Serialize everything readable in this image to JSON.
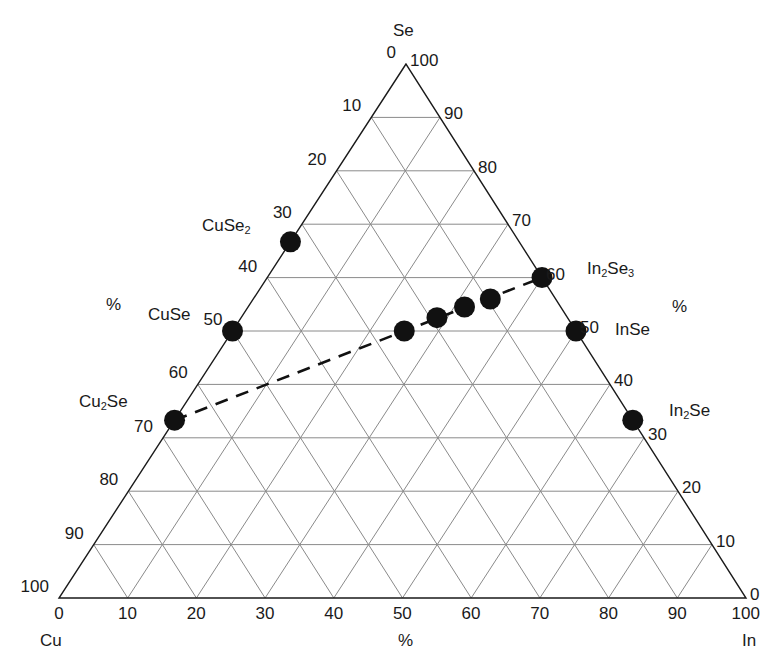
{
  "chart_data": {
    "type": "ternary-scatter",
    "title": "",
    "vertices": {
      "top": "Se",
      "bottom_left": "Cu",
      "bottom_right": "In"
    },
    "axis_unit_label": "%",
    "ticks": [
      0,
      10,
      20,
      30,
      40,
      50,
      60,
      70,
      80,
      90,
      100
    ],
    "left_axis_ticks_top_to_bottom": [
      "0",
      "10",
      "20",
      "30",
      "40",
      "50",
      "60",
      "70",
      "80",
      "90",
      "100"
    ],
    "right_axis_ticks_top_to_bottom": [
      "100",
      "90",
      "80",
      "70",
      "60",
      "50",
      "40",
      "30",
      "20",
      "10",
      "0"
    ],
    "bottom_axis_ticks_left_to_right": [
      "0",
      "10",
      "20",
      "30",
      "40",
      "50",
      "60",
      "70",
      "80",
      "90",
      "100"
    ],
    "grid": true,
    "grid_step": 10,
    "points": [
      {
        "label": "CuSe2",
        "label_main": "CuSe",
        "label_sub": "2",
        "Cu": 33.3,
        "In": 0,
        "Se": 66.7
      },
      {
        "label": "CuSe",
        "label_main": "CuSe",
        "label_sub": "",
        "Cu": 50,
        "In": 0,
        "Se": 50
      },
      {
        "label": "Cu2Se",
        "label_main": "Cu",
        "label_sub": "2",
        "label_tail": "Se",
        "Cu": 66.7,
        "In": 0,
        "Se": 33.3
      },
      {
        "label": "In2Se3",
        "label_main": "In",
        "label_sub": "2",
        "label_tail": "Se",
        "label_sub2": "3",
        "Cu": 0,
        "In": 40,
        "Se": 60
      },
      {
        "label": "InSe",
        "label_main": "InSe",
        "label_sub": "",
        "Cu": 0,
        "In": 50,
        "Se": 50
      },
      {
        "label": "In2Se",
        "label_main": "In",
        "label_sub": "2",
        "label_tail": "Se",
        "Cu": 0,
        "In": 66.7,
        "Se": 33.3
      },
      {
        "label": "",
        "Cu": 25,
        "In": 25,
        "Se": 50
      },
      {
        "label": "",
        "Cu": 19,
        "In": 28.5,
        "Se": 52.5
      },
      {
        "label": "",
        "Cu": 14,
        "In": 31.5,
        "Se": 54.5
      },
      {
        "label": "",
        "Cu": 9.5,
        "In": 34.5,
        "Se": 56
      }
    ],
    "tie_line": {
      "style": "dashed",
      "from": "Cu2Se",
      "to": "In2Se3"
    },
    "colors": {
      "axis": "#1a1a1a",
      "grid": "#8a8a8a",
      "points": "#111111"
    }
  },
  "labels": {
    "apex_se": "Se",
    "corner_cu": "Cu",
    "corner_in": "In",
    "percent_left": "%",
    "percent_right": "%",
    "percent_bottom": "%",
    "cuse2_main": "CuSe",
    "cuse2_sub": "2",
    "cuse": "CuSe",
    "cu2se_a": "Cu",
    "cu2se_sub": "2",
    "cu2se_b": "Se",
    "in2se3_a": "In",
    "in2se3_sub": "2",
    "in2se3_b": "Se",
    "in2se3_sub2": "3",
    "inse": "InSe",
    "in2se_a": "In",
    "in2se_sub": "2",
    "in2se_b": "Se"
  }
}
